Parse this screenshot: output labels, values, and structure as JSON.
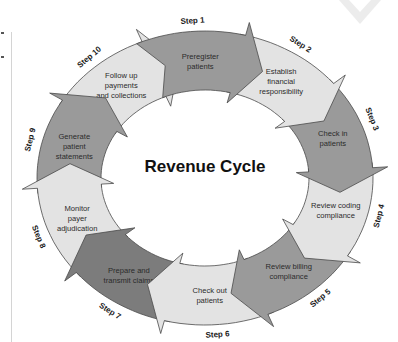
{
  "diagram": {
    "title": "Revenue Cycle",
    "colors": {
      "dark": "#9a9a9a",
      "medium": "#b3b3b3",
      "light": "#e3e3e3",
      "darkest": "#7c7c7c",
      "stroke": "#4a4a4a",
      "watermark": "#ececec"
    },
    "steps": [
      {
        "step": "Step 1",
        "lines": [
          "Preregister",
          "patients"
        ],
        "shade": "dark"
      },
      {
        "step": "Step 2",
        "lines": [
          "Establish",
          "financial",
          "responsibility"
        ],
        "shade": "light"
      },
      {
        "step": "Step 3",
        "lines": [
          "Check in",
          "patients"
        ],
        "shade": "dark"
      },
      {
        "step": "Step 4",
        "lines": [
          "Review coding",
          "compliance"
        ],
        "shade": "light"
      },
      {
        "step": "Step 5",
        "lines": [
          "Review billing",
          "compliance"
        ],
        "shade": "dark"
      },
      {
        "step": "Step 6",
        "lines": [
          "Check out",
          "patients"
        ],
        "shade": "light"
      },
      {
        "step": "Step 7",
        "lines": [
          "Prepare and",
          "transmit claims"
        ],
        "shade": "darkest"
      },
      {
        "step": "Step 8",
        "lines": [
          "Monitor",
          "payer",
          "adjudication"
        ],
        "shade": "light"
      },
      {
        "step": "Step 9",
        "lines": [
          "Generate",
          "patient",
          "statements"
        ],
        "shade": "dark"
      },
      {
        "step": "Step 10",
        "lines": [
          "Follow up",
          "payments",
          "and collections"
        ],
        "shade": "light"
      }
    ]
  }
}
